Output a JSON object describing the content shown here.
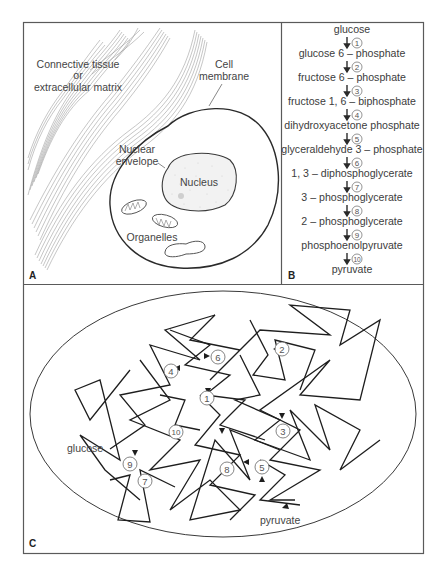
{
  "figure": {
    "panels": {
      "A": {
        "letter": "A",
        "labels": {
          "connective_line1": "Connective tissue",
          "connective_line2": "or",
          "connective_line3": "extracellular matrix",
          "membrane_line1": "Cell",
          "membrane_line2": "membrane",
          "envelope_line1": "Nuclear",
          "envelope_line2": "envelope",
          "nucleus": "Nucleus",
          "organelles": "Organelles"
        }
      },
      "B": {
        "letter": "B",
        "pathway": [
          "glucose",
          "glucose 6 – phosphate",
          "fructose 6 – phosphate",
          "fructose 1, 6 – biphosphate",
          "dihydroxyacetone phosphate",
          "glyceraldehyde 3 – phosphate",
          "1, 3 – diphosphoglycerate",
          "3 – phosphoglycerate",
          "2 – phosphoglycerate",
          "phosphoenolpyruvate",
          "pyruvate"
        ],
        "steps": [
          "1",
          "2",
          "3",
          "4",
          "5",
          "6",
          "7",
          "8",
          "9",
          "10"
        ]
      },
      "C": {
        "letter": "C",
        "start_label": "glucose",
        "end_label": "pyruvate",
        "enzymes": [
          "1",
          "2",
          "3",
          "4",
          "5",
          "6",
          "7",
          "8",
          "9",
          "10"
        ]
      }
    },
    "colors": {
      "line": "#2a2a2a",
      "frame": "#555555",
      "text": "#444444",
      "fiber": "#8a8a8a",
      "nucleus_fill": "#f1f1f1"
    }
  }
}
